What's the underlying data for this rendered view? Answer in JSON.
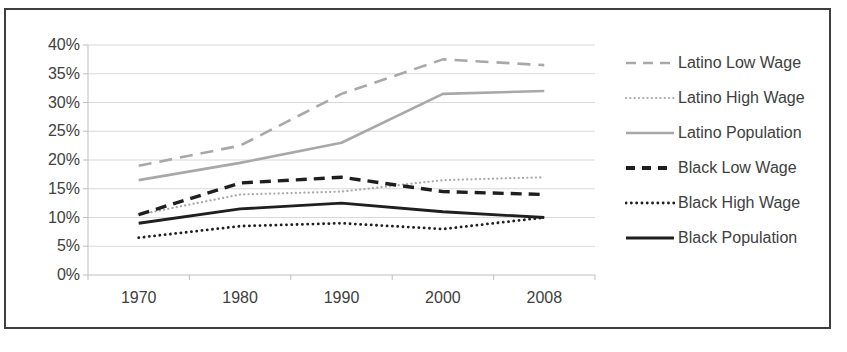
{
  "chart_data": {
    "type": "line",
    "title": "",
    "xlabel": "",
    "ylabel": "",
    "categories": [
      "1970",
      "1980",
      "1990",
      "2000",
      "2008"
    ],
    "series": [
      {
        "name": "Latino Low Wage",
        "color": "#a8a8a8",
        "style": "dashed",
        "values": [
          19,
          22.5,
          31.5,
          37.5,
          36.5
        ]
      },
      {
        "name": "Latino High Wage",
        "color": "#a8a8a8",
        "style": "dotted",
        "values": [
          10.5,
          14,
          14.5,
          16.5,
          17
        ]
      },
      {
        "name": "Latino Population",
        "color": "#a8a8a8",
        "style": "solid",
        "values": [
          16.5,
          19.5,
          23,
          31.5,
          32
        ]
      },
      {
        "name": "Black Low Wage",
        "color": "#1f1f1f",
        "style": "dashed",
        "values": [
          10.5,
          16,
          17,
          14.5,
          14
        ]
      },
      {
        "name": "Black High Wage",
        "color": "#1f1f1f",
        "style": "dotted",
        "values": [
          6.5,
          8.5,
          9,
          8,
          10
        ]
      },
      {
        "name": "Black Population",
        "color": "#1f1f1f",
        "style": "solid",
        "values": [
          9,
          11.5,
          12.5,
          11,
          10
        ]
      }
    ],
    "yticks": [
      "40%",
      "35%",
      "30%",
      "25%",
      "20%",
      "15%",
      "10%",
      "5%",
      "0%"
    ],
    "ylim": [
      0,
      40
    ],
    "grid": true,
    "legend_position": "right"
  },
  "colors": {
    "grid": "#d9d9d9",
    "axis": "#bfbfbf",
    "text": "#404040",
    "frame_border": "#3f3f3f",
    "background": "#ffffff"
  }
}
